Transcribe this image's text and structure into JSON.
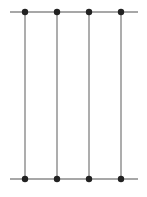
{
  "diagram": {
    "width": 147,
    "height": 197,
    "colors": {
      "line": "#8a8a8a",
      "node": "#222222",
      "background": "#ffffff"
    },
    "rails": [
      {
        "name": "top-rail",
        "y": 12,
        "x1": 10,
        "x2": 138
      },
      {
        "name": "bottom-rail",
        "y": 179,
        "x1": 10,
        "x2": 138
      }
    ],
    "verticals": [
      {
        "name": "vertical-line-1",
        "x": 25
      },
      {
        "name": "vertical-line-2",
        "x": 57
      },
      {
        "name": "vertical-line-3",
        "x": 89
      },
      {
        "name": "vertical-line-4",
        "x": 121
      }
    ],
    "node_radius": 3.2
  }
}
